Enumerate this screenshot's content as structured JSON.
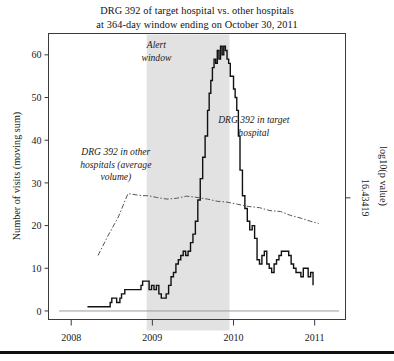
{
  "figure": {
    "title_lines": [
      "DRG 392 of target hospital vs. other hospitals",
      "at 364-day window ending on October 30, 2011"
    ],
    "background_color": "#ffffff",
    "plot_border_color": "#3b3b3b",
    "series_target_color": "#111111",
    "series_other_color": "#555555",
    "alert_window_fill": "#e2e2e2",
    "bottom_rule_color": "#111111"
  },
  "chart_data": {
    "type": "line",
    "title": "DRG 392 of target hospital vs. other hospitals at 364-day window ending on October 30, 2011",
    "xlabel": "",
    "ylabel": "Number of visits (moving sum)",
    "y2label": "log10(p value)",
    "xlim": [
      2007.72,
      2011.38
    ],
    "ylim": [
      -2,
      65
    ],
    "grid": false,
    "legend_position": "inline-annotations",
    "xticks": [
      "2008",
      "2009",
      "2010",
      "2011"
    ],
    "xtick_values": [
      2008,
      2009,
      2010,
      2011
    ],
    "yticks": [
      "0",
      "10",
      "20",
      "30",
      "40",
      "50",
      "60"
    ],
    "ytick_values": [
      0,
      10,
      20,
      30,
      40,
      50,
      60
    ],
    "y2ticks": [
      "16.43419"
    ],
    "y2tick_positions": [
      26.5
    ],
    "annotations": [
      {
        "name": "alert-window",
        "text_lines": [
          "Alert",
          "window"
        ],
        "x": 2009.05,
        "y": 61.5,
        "italic": true
      },
      {
        "name": "other-hospitals",
        "text_lines": [
          "DRG 392 in other",
          "hospitals (average",
          "volume)"
        ],
        "x": 2008.55,
        "y": 36.5,
        "italic": true
      },
      {
        "name": "target-hospital",
        "text_lines": [
          "DRG 392 in target",
          "hospital"
        ],
        "x": 2010.25,
        "y": 44.0,
        "italic": true
      }
    ],
    "shaded_regions": [
      {
        "name": "alert-window-band",
        "x_start": 2008.93,
        "x_end": 2009.95,
        "label": "Alert window"
      }
    ],
    "baseline": {
      "y": 0,
      "x_start": 2007.85,
      "x_end": 2011.3
    },
    "series": [
      {
        "name": "DRG 392 in target hospital",
        "style": "solid",
        "x": [
          2008.2,
          2008.28,
          2008.32,
          2008.4,
          2008.44,
          2008.48,
          2008.5,
          2008.54,
          2008.56,
          2008.6,
          2008.62,
          2008.66,
          2008.7,
          2008.74,
          2008.78,
          2008.82,
          2008.86,
          2008.88,
          2008.9,
          2008.93,
          2008.96,
          2008.99,
          2009.02,
          2009.05,
          2009.08,
          2009.11,
          2009.14,
          2009.17,
          2009.2,
          2009.23,
          2009.26,
          2009.29,
          2009.32,
          2009.35,
          2009.38,
          2009.41,
          2009.44,
          2009.47,
          2009.5,
          2009.53,
          2009.56,
          2009.59,
          2009.62,
          2009.65,
          2009.68,
          2009.7,
          2009.72,
          2009.74,
          2009.76,
          2009.78,
          2009.8,
          2009.82,
          2009.84,
          2009.86,
          2009.88,
          2009.9,
          2009.92,
          2009.94,
          2009.96,
          2009.98,
          2010.0,
          2010.02,
          2010.04,
          2010.06,
          2010.08,
          2010.11,
          2010.14,
          2010.17,
          2010.2,
          2010.23,
          2010.26,
          2010.29,
          2010.32,
          2010.35,
          2010.38,
          2010.41,
          2010.44,
          2010.47,
          2010.5,
          2010.53,
          2010.56,
          2010.59,
          2010.62,
          2010.65,
          2010.68,
          2010.71,
          2010.74,
          2010.77,
          2010.8,
          2010.83,
          2010.86,
          2010.89,
          2010.92,
          2010.95,
          2010.98
        ],
        "y": [
          1,
          1,
          1,
          1,
          1,
          2,
          3,
          3,
          2,
          3,
          4,
          5,
          5,
          5,
          5,
          5,
          6,
          7,
          7,
          7,
          5,
          6,
          5,
          6,
          4,
          3,
          3,
          4,
          6,
          8,
          9,
          11,
          12,
          13,
          14,
          13,
          14,
          16,
          18,
          21,
          26,
          31,
          36,
          41,
          47,
          51,
          54,
          57,
          59,
          58,
          61,
          59,
          62,
          60,
          62,
          61,
          59,
          58,
          55,
          55,
          52,
          50,
          47,
          41,
          33,
          27,
          24,
          21,
          19,
          20,
          17,
          12,
          11,
          13,
          14,
          11,
          10,
          9,
          11,
          12,
          13,
          14,
          14,
          14,
          13,
          11,
          10,
          9,
          9,
          8,
          10,
          10,
          8,
          9,
          6
        ]
      },
      {
        "name": "DRG 392 in other hospitals (average volume)",
        "style": "dash-dot",
        "x": [
          2008.33,
          2008.45,
          2008.58,
          2008.7,
          2008.8,
          2008.88,
          2008.95,
          2009.05,
          2009.18,
          2009.3,
          2009.42,
          2009.55,
          2009.68,
          2009.8,
          2009.92,
          2010.05,
          2010.18,
          2010.32,
          2010.45,
          2010.58,
          2010.7,
          2010.82,
          2010.95,
          2011.05
        ],
        "y": [
          13.0,
          17.5,
          22.0,
          27.5,
          27.2,
          27.0,
          27.0,
          26.6,
          26.2,
          26.4,
          26.9,
          26.6,
          26.2,
          25.7,
          25.5,
          25.0,
          24.5,
          24.2,
          23.5,
          23.3,
          22.4,
          21.8,
          21.0,
          20.5
        ]
      }
    ]
  },
  "axes": {
    "left_axis_title": "Number of visits (moving sum)",
    "right_axis_title": "log10(p value)",
    "right_axis_tick": "16.43419"
  }
}
